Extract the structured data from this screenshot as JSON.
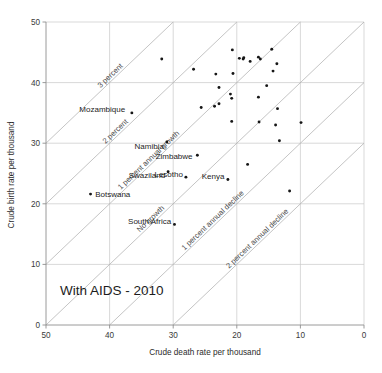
{
  "chart_data": {
    "type": "scatter",
    "title": "With AIDS - 2010",
    "xlabel": "Crude death rate per thousand",
    "ylabel": "Crude birth rate per thousand",
    "xlim": [
      50,
      0
    ],
    "ylim": [
      0,
      50
    ],
    "x_reversed": true,
    "xticks": [
      50,
      40,
      30,
      20,
      10,
      0
    ],
    "yticks": [
      0,
      10,
      20,
      30,
      40,
      50
    ],
    "xtick_labels": [
      "50",
      "40",
      "30",
      "20",
      "10",
      "0"
    ],
    "ytick_labels": [
      "0",
      "10",
      "20",
      "30",
      "40",
      "50"
    ],
    "grid": true,
    "legend": "none",
    "reference_lines": [
      {
        "name": "no-growth",
        "label": "No growth",
        "sum": 50,
        "label_t": 0.3
      },
      {
        "name": "one-percent-growth",
        "label": "1 percent annual growth",
        "sum": 60,
        "label_t": 0.3
      },
      {
        "name": "two-percent",
        "label": "2 percent",
        "sum": 70,
        "label_t": 0.32
      },
      {
        "name": "three-percent",
        "label": "3 percent",
        "sum": 80,
        "label_t": 0.44
      },
      {
        "name": "one-percent-decline",
        "label": "1 percent annual decline",
        "sum": 40,
        "label_t": 0.3
      },
      {
        "name": "two-percent-decline",
        "label": "2 percent annual decline",
        "sum": 30,
        "label_t": 0.3
      }
    ],
    "labeled_points": [
      {
        "country": "Mozambique",
        "x": 36.5,
        "y": 35.0,
        "label_dx": -3.0,
        "label_dy": -2.2,
        "anchor": "end"
      },
      {
        "country": "Namibia",
        "x": 31.0,
        "y": 30.2,
        "label_dx": 1.2,
        "label_dy": 2.6,
        "anchor": "end"
      },
      {
        "country": "Zimbabwe",
        "x": 26.2,
        "y": 28.0,
        "label_dx": -0.9,
        "label_dy": 0.3,
        "anchor": "end"
      },
      {
        "country": "Swaziland",
        "x": 30.8,
        "y": 25.3,
        "label_dx": 1.2,
        "label_dy": 1.9,
        "anchor": "end"
      },
      {
        "country": "Lesotho",
        "x": 28.0,
        "y": 24.4,
        "label_dx": 1.1,
        "label_dy": -1.8,
        "anchor": "end"
      },
      {
        "country": "Kenya",
        "x": 21.4,
        "y": 24.0,
        "label_dx": 0.6,
        "label_dy": -1.8,
        "anchor": "end"
      },
      {
        "country": "Botswana",
        "x": 43.0,
        "y": 21.6,
        "label_dx": 0.7,
        "label_dy": 0.2,
        "anchor": "start"
      },
      {
        "country": "South Africa",
        "x": 29.8,
        "y": 16.6,
        "label_dx": 0.8,
        "label_dy": -1.9,
        "anchor": "end"
      }
    ],
    "unlabeled_points": [
      {
        "x": 31.8,
        "y": 43.9
      },
      {
        "x": 26.8,
        "y": 42.2
      },
      {
        "x": 23.3,
        "y": 41.4
      },
      {
        "x": 20.7,
        "y": 45.4
      },
      {
        "x": 19.6,
        "y": 44.0
      },
      {
        "x": 19.0,
        "y": 43.9
      },
      {
        "x": 18.9,
        "y": 44.1
      },
      {
        "x": 20.6,
        "y": 41.5
      },
      {
        "x": 22.8,
        "y": 39.2
      },
      {
        "x": 17.9,
        "y": 43.5
      },
      {
        "x": 16.6,
        "y": 44.2
      },
      {
        "x": 16.3,
        "y": 43.9
      },
      {
        "x": 14.5,
        "y": 45.5
      },
      {
        "x": 13.7,
        "y": 43.1
      },
      {
        "x": 14.3,
        "y": 41.9
      },
      {
        "x": 21.0,
        "y": 38.1
      },
      {
        "x": 20.8,
        "y": 37.4
      },
      {
        "x": 23.5,
        "y": 36.1
      },
      {
        "x": 22.8,
        "y": 36.5
      },
      {
        "x": 15.3,
        "y": 39.5
      },
      {
        "x": 16.6,
        "y": 37.6
      },
      {
        "x": 25.6,
        "y": 35.9
      },
      {
        "x": 13.6,
        "y": 35.7
      },
      {
        "x": 20.8,
        "y": 33.6
      },
      {
        "x": 16.5,
        "y": 33.5
      },
      {
        "x": 13.9,
        "y": 33.0
      },
      {
        "x": 9.9,
        "y": 33.4
      },
      {
        "x": 13.3,
        "y": 30.4
      },
      {
        "x": 18.3,
        "y": 26.5
      },
      {
        "x": 11.7,
        "y": 22.1
      }
    ]
  }
}
